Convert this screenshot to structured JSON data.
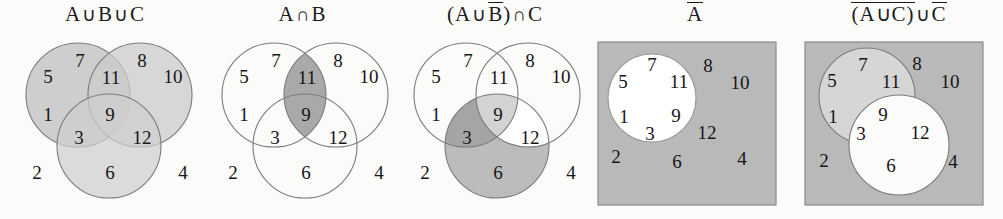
{
  "figure": {
    "kind": "venn-diagram-set",
    "panel_count": 5,
    "universe_elements": [
      "1",
      "2",
      "3",
      "4",
      "5",
      "6",
      "7",
      "8",
      "9",
      "10",
      "11",
      "12"
    ]
  },
  "colors": {
    "page_background": "#fbfbfa",
    "stroke": "#7b7b7b",
    "shade_light": "#cccccc",
    "shade_medium": "#bdbdbd",
    "shade_dark": "#a8a8a8",
    "rect_fill": "#b9b9b9",
    "white": "#ffffff",
    "text": "#161616"
  },
  "panels": [
    {
      "id": "a-union-b-union-c",
      "title": {
        "parts": [
          {
            "text": "A",
            "overline": false
          },
          {
            "text": "∪",
            "overline": false,
            "operator": true
          },
          {
            "text": "B",
            "overline": false
          },
          {
            "text": "∪",
            "overline": false,
            "operator": true
          },
          {
            "text": "C",
            "overline": false
          }
        ],
        "plain": "A∪B∪C"
      },
      "has_rectangle": false,
      "regions": [
        {
          "name": "a-only",
          "label": "5",
          "shaded": true
        },
        {
          "name": "a-only-upper",
          "label": "7",
          "shaded": true
        },
        {
          "name": "a-intersect-b",
          "label": "11",
          "shaded": true
        },
        {
          "name": "b-only-upper",
          "label": "8",
          "shaded": true
        },
        {
          "name": "b-only",
          "label": "10",
          "shaded": true
        },
        {
          "name": "a-only-lower",
          "label": "1",
          "shaded": true
        },
        {
          "name": "a-intersect-b-intersect-c",
          "label": "9",
          "shaded": true
        },
        {
          "name": "a-intersect-c",
          "label": "3",
          "shaded": true
        },
        {
          "name": "b-intersect-c",
          "label": "12",
          "shaded": true
        },
        {
          "name": "c-only",
          "label": "6",
          "shaded": true
        },
        {
          "name": "outside-left",
          "label": "2",
          "shaded": false
        },
        {
          "name": "outside-right",
          "label": "4",
          "shaded": false
        }
      ]
    },
    {
      "id": "a-intersect-b",
      "title": {
        "parts": [
          {
            "text": "A",
            "overline": false
          },
          {
            "text": "∩",
            "overline": false,
            "operator": true
          },
          {
            "text": "B",
            "overline": false
          }
        ],
        "plain": "A∩B"
      },
      "has_rectangle": false,
      "regions": [
        {
          "name": "a-only",
          "label": "5",
          "shaded": false
        },
        {
          "name": "a-only-upper",
          "label": "7",
          "shaded": false
        },
        {
          "name": "a-intersect-b",
          "label": "11",
          "shaded": true
        },
        {
          "name": "b-only-upper",
          "label": "8",
          "shaded": false
        },
        {
          "name": "b-only",
          "label": "10",
          "shaded": false
        },
        {
          "name": "a-only-lower",
          "label": "1",
          "shaded": false
        },
        {
          "name": "a-intersect-b-intersect-c",
          "label": "9",
          "shaded": true
        },
        {
          "name": "a-intersect-c",
          "label": "3",
          "shaded": false
        },
        {
          "name": "b-intersect-c",
          "label": "12",
          "shaded": false
        },
        {
          "name": "c-only",
          "label": "6",
          "shaded": false
        },
        {
          "name": "outside-left",
          "label": "2",
          "shaded": false
        },
        {
          "name": "outside-right",
          "label": "4",
          "shaded": false
        }
      ]
    },
    {
      "id": "a-union-not-b-intersect-c",
      "title": {
        "parts": [
          {
            "text": "(A",
            "overline": false
          },
          {
            "text": "∪",
            "overline": false,
            "operator": true
          },
          {
            "text": "B",
            "overline": true
          },
          {
            "text": ")",
            "overline": false
          },
          {
            "text": "∩",
            "overline": false,
            "operator": true
          },
          {
            "text": "C",
            "overline": false
          }
        ],
        "plain": "(A∪B̅)∩C"
      },
      "has_rectangle": false,
      "regions": [
        {
          "name": "a-only",
          "label": "5",
          "shaded": false
        },
        {
          "name": "a-only-upper",
          "label": "7",
          "shaded": false
        },
        {
          "name": "a-intersect-b",
          "label": "11",
          "shaded": false
        },
        {
          "name": "b-only-upper",
          "label": "8",
          "shaded": false
        },
        {
          "name": "b-only",
          "label": "10",
          "shaded": false
        },
        {
          "name": "a-only-lower",
          "label": "1",
          "shaded": false
        },
        {
          "name": "a-intersect-b-intersect-c",
          "label": "9",
          "shaded": true
        },
        {
          "name": "a-intersect-c",
          "label": "3",
          "shaded": true
        },
        {
          "name": "b-intersect-c",
          "label": "12",
          "shaded": false
        },
        {
          "name": "c-only",
          "label": "6",
          "shaded": true
        },
        {
          "name": "outside-left",
          "label": "2",
          "shaded": false
        },
        {
          "name": "outside-right",
          "label": "4",
          "shaded": false
        }
      ]
    },
    {
      "id": "not-a",
      "title": {
        "parts": [
          {
            "text": "A",
            "overline": true
          }
        ],
        "plain": "A̅"
      },
      "has_rectangle": true,
      "regions": [
        {
          "name": "inside-a-7",
          "label": "7",
          "shaded": false
        },
        {
          "name": "inside-a-5",
          "label": "5",
          "shaded": false
        },
        {
          "name": "inside-a-11",
          "label": "11",
          "shaded": false
        },
        {
          "name": "inside-a-1",
          "label": "1",
          "shaded": false
        },
        {
          "name": "inside-a-9",
          "label": "9",
          "shaded": false
        },
        {
          "name": "inside-a-3",
          "label": "3",
          "shaded": false
        },
        {
          "name": "outside-a-8",
          "label": "8",
          "shaded": true
        },
        {
          "name": "outside-a-10",
          "label": "10",
          "shaded": true
        },
        {
          "name": "outside-a-12",
          "label": "12",
          "shaded": true
        },
        {
          "name": "outside-a-2",
          "label": "2",
          "shaded": true
        },
        {
          "name": "outside-a-6",
          "label": "6",
          "shaded": true
        },
        {
          "name": "outside-a-4",
          "label": "4",
          "shaded": true
        }
      ]
    },
    {
      "id": "not-a-union-c-union-not-c",
      "title": {
        "parts": [
          {
            "text": "(A∪C)",
            "overline": true
          },
          {
            "text": "∪",
            "overline": false,
            "operator": true
          },
          {
            "text": "C",
            "overline": true
          }
        ],
        "plain": "(A∪C)̅∪C̅"
      },
      "has_rectangle": true,
      "regions": [
        {
          "name": "a-only-7",
          "label": "7",
          "shaded": false
        },
        {
          "name": "a-only-5",
          "label": "5",
          "shaded": false
        },
        {
          "name": "a-only-11",
          "label": "11",
          "shaded": false
        },
        {
          "name": "a-only-1",
          "label": "1",
          "shaded": false
        },
        {
          "name": "a-intersect-c-9",
          "label": "9",
          "shaded": false
        },
        {
          "name": "a-intersect-c-3",
          "label": "3",
          "shaded": false
        },
        {
          "name": "c-only-12",
          "label": "12",
          "shaded": false
        },
        {
          "name": "c-only-6",
          "label": "6",
          "shaded": false
        },
        {
          "name": "outside-8",
          "label": "8",
          "shaded": true
        },
        {
          "name": "outside-10",
          "label": "10",
          "shaded": true
        },
        {
          "name": "outside-2",
          "label": "2",
          "shaded": true
        },
        {
          "name": "outside-4",
          "label": "4",
          "shaded": true
        }
      ]
    }
  ]
}
